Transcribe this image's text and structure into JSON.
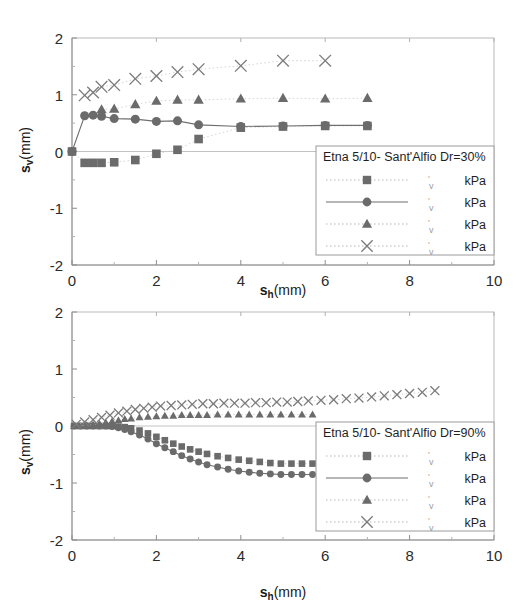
{
  "figure": {
    "background": "#ffffff",
    "marker_color": "#6b6b6b",
    "line_color": "#6f6f6f",
    "frame_color": "#b9b9b9"
  },
  "chart_data": [
    {
      "type": "scatter",
      "title": "",
      "panel": "top",
      "xlabel": "s_h(mm)",
      "ylabel": "s_v(mm)",
      "xlabel_main": "s",
      "xlabel_sub": "h",
      "xlabel_unit": "(mm)",
      "ylabel_main": "s",
      "ylabel_sub": "v",
      "ylabel_unit": "(mm)",
      "xlim": [
        0,
        10
      ],
      "ylim": [
        -2,
        2
      ],
      "xticks": [
        0,
        2,
        4,
        6,
        8,
        10
      ],
      "yticks": [
        2,
        1,
        0,
        -1,
        -2
      ],
      "xticklabels": [
        "0",
        "2",
        "4",
        "6",
        "8",
        "10"
      ],
      "yticklabels": [
        "2",
        "1",
        "0",
        "-1",
        "-2"
      ],
      "grid": false,
      "legend_position": "lower-right",
      "legend_title": "Etna 5/10- Sant'Alfio Dr=30%",
      "legend_entries": [
        {
          "marker": "square",
          "line": "dotted",
          "value": "",
          "unit": "kPa"
        },
        {
          "marker": "circle",
          "line": "solid",
          "value": "",
          "unit": "kPa"
        },
        {
          "marker": "triangle",
          "line": "dotted",
          "value": "",
          "unit": "kPa"
        },
        {
          "marker": "cross",
          "line": "dotted",
          "value": "",
          "unit": "kPa"
        }
      ],
      "series": [
        {
          "name": "square",
          "marker": "square",
          "line": "dotted",
          "x": [
            0.0,
            0.3,
            0.5,
            0.7,
            1.0,
            1.5,
            2.0,
            2.5,
            3.0,
            4.0,
            5.0,
            6.0,
            7.0
          ],
          "y": [
            0.0,
            -0.2,
            -0.2,
            -0.2,
            -0.19,
            -0.15,
            -0.04,
            0.03,
            0.22,
            0.42,
            0.44,
            0.45,
            0.45
          ]
        },
        {
          "name": "circle",
          "marker": "circle",
          "line": "solid",
          "x": [
            0.0,
            0.3,
            0.5,
            0.7,
            1.0,
            1.5,
            2.0,
            2.5,
            3.0,
            4.0,
            5.0,
            6.0,
            7.0
          ],
          "y": [
            0.0,
            0.63,
            0.64,
            0.62,
            0.58,
            0.57,
            0.53,
            0.54,
            0.47,
            0.44,
            0.45,
            0.46,
            0.46
          ]
        },
        {
          "name": "triangle",
          "marker": "triangle",
          "line": "dotted",
          "x": [
            0.7,
            1.0,
            1.5,
            2.0,
            2.5,
            3.0,
            4.0,
            5.0,
            6.0,
            7.0
          ],
          "y": [
            0.74,
            0.75,
            0.83,
            0.89,
            0.91,
            0.91,
            0.93,
            0.94,
            0.93,
            0.94
          ]
        },
        {
          "name": "cross",
          "marker": "cross",
          "line": "dotted",
          "x": [
            0.3,
            0.5,
            0.7,
            1.0,
            1.5,
            2.0,
            2.5,
            3.0,
            4.0,
            5.0,
            6.0
          ],
          "y": [
            0.99,
            1.04,
            1.14,
            1.17,
            1.28,
            1.33,
            1.4,
            1.45,
            1.51,
            1.6,
            1.6
          ]
        }
      ]
    },
    {
      "type": "scatter",
      "title": "",
      "panel": "bottom",
      "xlabel": "s_h(mm)",
      "ylabel": "s_v(mm)",
      "xlabel_main": "s",
      "xlabel_sub": "h",
      "xlabel_unit": "(mm)",
      "ylabel_main": "s",
      "ylabel_sub": "v",
      "ylabel_unit": "(mm)",
      "xlim": [
        0,
        10
      ],
      "ylim": [
        -2,
        2
      ],
      "xticks": [
        0,
        2,
        4,
        6,
        8,
        10
      ],
      "yticks": [
        2,
        1,
        0,
        -1,
        -2
      ],
      "xticklabels": [
        "0",
        "2",
        "4",
        "6",
        "8",
        "10"
      ],
      "yticklabels": [
        "2",
        "1",
        "0",
        "-1",
        "-2"
      ],
      "grid": false,
      "legend_position": "lower-right",
      "legend_title": "Etna 5/10- Sant'Alfio Dr=90%",
      "legend_entries": [
        {
          "marker": "square",
          "line": "dotted",
          "value": "",
          "unit": "kPa"
        },
        {
          "marker": "circle",
          "line": "solid",
          "value": "",
          "unit": "kPa"
        },
        {
          "marker": "triangle",
          "line": "dotted",
          "value": "",
          "unit": "kPa"
        },
        {
          "marker": "cross",
          "line": "dotted",
          "value": "",
          "unit": "kPa"
        }
      ],
      "series": [
        {
          "name": "square",
          "marker": "square",
          "line": "dotted",
          "x": [
            0.05,
            0.2,
            0.35,
            0.5,
            0.65,
            0.8,
            0.95,
            1.1,
            1.25,
            1.4,
            1.6,
            1.8,
            2.0,
            2.2,
            2.4,
            2.6,
            2.8,
            3.0,
            3.2,
            3.45,
            3.7,
            3.95,
            4.2,
            4.45,
            4.7,
            4.95,
            5.2,
            5.45,
            5.7
          ],
          "y": [
            0.0,
            0.0,
            0.0,
            0.0,
            0.0,
            0.0,
            0.0,
            -0.01,
            -0.02,
            -0.04,
            -0.08,
            -0.13,
            -0.19,
            -0.25,
            -0.31,
            -0.36,
            -0.41,
            -0.45,
            -0.49,
            -0.53,
            -0.56,
            -0.59,
            -0.61,
            -0.63,
            -0.65,
            -0.66,
            -0.66,
            -0.66,
            -0.66
          ]
        },
        {
          "name": "circle",
          "marker": "circle",
          "line": "solid",
          "x": [
            0.05,
            0.2,
            0.35,
            0.5,
            0.65,
            0.8,
            0.95,
            1.1,
            1.25,
            1.4,
            1.6,
            1.8,
            2.0,
            2.2,
            2.4,
            2.6,
            2.8,
            3.0,
            3.2,
            3.45,
            3.7,
            3.95,
            4.2,
            4.45,
            4.7,
            4.95,
            5.2,
            5.45,
            5.7
          ],
          "y": [
            0.0,
            0.0,
            0.0,
            0.0,
            0.0,
            0.0,
            -0.01,
            -0.03,
            -0.06,
            -0.1,
            -0.16,
            -0.23,
            -0.31,
            -0.38,
            -0.45,
            -0.52,
            -0.58,
            -0.63,
            -0.68,
            -0.72,
            -0.76,
            -0.79,
            -0.81,
            -0.83,
            -0.84,
            -0.85,
            -0.85,
            -0.85,
            -0.85
          ]
        },
        {
          "name": "triangle",
          "marker": "triangle",
          "line": "dotted",
          "x": [
            0.05,
            0.2,
            0.35,
            0.5,
            0.65,
            0.8,
            0.95,
            1.1,
            1.25,
            1.4,
            1.6,
            1.8,
            2.0,
            2.2,
            2.4,
            2.6,
            2.8,
            3.0,
            3.2,
            3.45,
            3.7,
            3.95,
            4.2,
            4.45,
            4.7,
            4.95,
            5.2,
            5.45,
            5.7
          ],
          "y": [
            0.0,
            0.0,
            0.01,
            0.02,
            0.04,
            0.06,
            0.08,
            0.1,
            0.12,
            0.13,
            0.15,
            0.16,
            0.17,
            0.18,
            0.18,
            0.19,
            0.19,
            0.19,
            0.19,
            0.2,
            0.2,
            0.2,
            0.2,
            0.2,
            0.2,
            0.2,
            0.2,
            0.2,
            0.2
          ]
        },
        {
          "name": "cross",
          "marker": "cross",
          "line": "dotted",
          "x": [
            0.1,
            0.3,
            0.5,
            0.7,
            0.9,
            1.1,
            1.3,
            1.5,
            1.7,
            1.9,
            2.1,
            2.35,
            2.6,
            2.85,
            3.1,
            3.35,
            3.6,
            3.85,
            4.1,
            4.35,
            4.6,
            4.85,
            5.1,
            5.35,
            5.6,
            5.9,
            6.2,
            6.5,
            6.8,
            7.1,
            7.4,
            7.7,
            8.0,
            8.3,
            8.6
          ],
          "y": [
            0.03,
            0.07,
            0.11,
            0.15,
            0.19,
            0.23,
            0.26,
            0.29,
            0.31,
            0.33,
            0.35,
            0.36,
            0.37,
            0.38,
            0.39,
            0.39,
            0.4,
            0.4,
            0.4,
            0.41,
            0.41,
            0.42,
            0.42,
            0.43,
            0.44,
            0.45,
            0.46,
            0.48,
            0.49,
            0.51,
            0.53,
            0.55,
            0.57,
            0.59,
            0.62
          ]
        }
      ]
    }
  ]
}
